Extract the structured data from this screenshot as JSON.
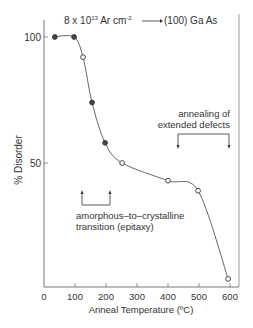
{
  "chart_data": {
    "type": "line",
    "title_parts": {
      "dose": "8 x 10",
      "exp": "13",
      "unit": " Ar cm",
      "unit_exp": "-2",
      "target": "(100) Ga As"
    },
    "xlabel": "Anneal Temperature (ºC)",
    "ylabel": "% Disorder",
    "xlim": [
      0,
      650
    ],
    "ylim": [
      0,
      105
    ],
    "x_ticks": [
      0,
      100,
      200,
      300,
      400,
      500,
      600
    ],
    "x_tick_labels": [
      "0",
      "100",
      "200",
      "300",
      "400",
      "500",
      "600"
    ],
    "y_ticks": [
      50,
      100
    ],
    "y_tick_labels": [
      "50",
      "100"
    ],
    "grid": false,
    "legend": null,
    "series": [
      {
        "name": "% Disorder",
        "x": [
          35,
          97,
          126,
          155,
          197,
          252,
          400,
          497,
          594
        ],
        "y": [
          100,
          100,
          92,
          74,
          58,
          50,
          43,
          39,
          4
        ]
      }
    ],
    "annotations": [
      {
        "text_lines": [
          "annealing of",
          "extended defects"
        ],
        "arrows_at_x": [
          430,
          600
        ],
        "align": "right"
      },
      {
        "text_lines": [
          "amorphous–to–crystalline",
          "transition (epitaxy)"
        ],
        "arrows_at_x": [
          120,
          180
        ],
        "align": "left"
      }
    ]
  },
  "colors": {
    "ink": "#333333",
    "axis": "#666666",
    "background": "#ffffff"
  }
}
